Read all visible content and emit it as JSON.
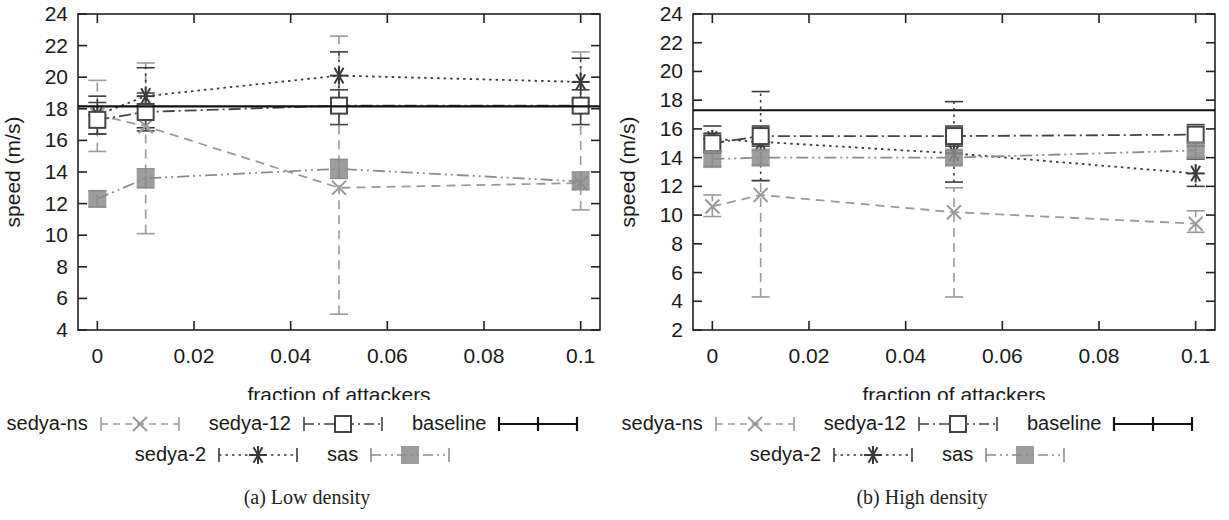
{
  "figure": {
    "panels": [
      {
        "id": "low-density",
        "caption": "(a) Low density",
        "chart_data": {
          "type": "line",
          "title": "",
          "subtitle": "",
          "xlabel": "fraction of attackers",
          "ylabel": "speed (m/s)",
          "x": [
            0,
            0.01,
            0.05,
            0.1
          ],
          "xticklabels": [
            "0",
            "0.02",
            "0.04",
            "0.06",
            "0.08",
            "0.1"
          ],
          "xticks": [
            0,
            0.02,
            0.04,
            0.06,
            0.08,
            0.1
          ],
          "xlim": [
            -0.004,
            0.104
          ],
          "yticklabels": [
            "4",
            "6",
            "8",
            "10",
            "12",
            "14",
            "16",
            "18",
            "20",
            "22",
            "24"
          ],
          "yticks": [
            4,
            6,
            8,
            10,
            12,
            14,
            16,
            18,
            20,
            22,
            24
          ],
          "ylim": [
            4,
            24
          ],
          "grid": false,
          "legend_position": "below",
          "series": [
            {
              "name": "sedya-ns",
              "marker": "x",
              "linestyle": "dashed",
              "color": "#9a9a9a",
              "values": [
                17.6,
                16.9,
                13.0,
                13.3
              ],
              "err_low": [
                15.3,
                10.1,
                5.0,
                11.6
              ],
              "err_high": [
                19.8,
                20.9,
                22.6,
                21.6
              ]
            },
            {
              "name": "sedya-2",
              "marker": "star",
              "linestyle": "dotted",
              "color": "#3a3a3a",
              "values": [
                17.6,
                18.8,
                20.1,
                19.7
              ],
              "err_low": [
                16.4,
                16.8,
                18.5,
                18.5
              ],
              "err_high": [
                18.8,
                20.6,
                21.6,
                21.2
              ]
            },
            {
              "name": "sedya-12",
              "marker": "open-square",
              "linestyle": "dashdot",
              "color": "#444444",
              "values": [
                17.3,
                17.8,
                18.2,
                18.2
              ],
              "err_low": [
                16.4,
                16.6,
                17.0,
                17.0
              ],
              "err_high": [
                18.4,
                19.0,
                19.2,
                19.2
              ]
            },
            {
              "name": "sas",
              "marker": "filled-square",
              "linestyle": "dashdotdot",
              "color": "#8c8c8c",
              "values": [
                12.3,
                13.6,
                14.2,
                13.4
              ],
              "err_low": [
                11.8,
                13.0,
                13.6,
                12.9
              ],
              "err_high": [
                12.8,
                14.2,
                14.8,
                14.0
              ]
            },
            {
              "name": "baseline",
              "marker": "none",
              "linestyle": "solid",
              "color": "#111111",
              "constant": 18.15,
              "values": [
                18.15,
                18.15,
                18.15,
                18.15
              ]
            }
          ]
        }
      },
      {
        "id": "high-density",
        "caption": "(b) High density",
        "chart_data": {
          "type": "line",
          "title": "",
          "subtitle": "",
          "xlabel": "fraction of attackers",
          "ylabel": "speed (m/s)",
          "x": [
            0,
            0.01,
            0.05,
            0.1
          ],
          "xticklabels": [
            "0",
            "0.02",
            "0.04",
            "0.06",
            "0.08",
            "0.1"
          ],
          "xticks": [
            0,
            0.02,
            0.04,
            0.06,
            0.08,
            0.1
          ],
          "xlim": [
            -0.004,
            0.104
          ],
          "yticklabels": [
            "2",
            "4",
            "6",
            "8",
            "10",
            "12",
            "14",
            "16",
            "18",
            "20",
            "22",
            "24"
          ],
          "yticks": [
            2,
            4,
            6,
            8,
            10,
            12,
            14,
            16,
            18,
            20,
            22,
            24
          ],
          "ylim": [
            2,
            24
          ],
          "grid": false,
          "legend_position": "below",
          "series": [
            {
              "name": "sedya-ns",
              "marker": "x",
              "linestyle": "dashed",
              "color": "#9a9a9a",
              "values": [
                10.6,
                11.4,
                10.2,
                9.4
              ],
              "err_low": [
                9.9,
                4.3,
                4.3,
                8.8
              ],
              "err_high": [
                11.4,
                12.4,
                11.9,
                10.3
              ]
            },
            {
              "name": "sedya-2",
              "marker": "star",
              "linestyle": "dotted",
              "color": "#3a3a3a",
              "values": [
                15.3,
                15.1,
                14.3,
                12.9
              ],
              "err_low": [
                14.4,
                12.4,
                12.3,
                12.0
              ],
              "err_high": [
                16.2,
                18.6,
                17.9,
                13.9
              ]
            },
            {
              "name": "sedya-12",
              "marker": "open-square",
              "linestyle": "dashdot",
              "color": "#444444",
              "values": [
                15.0,
                15.5,
                15.5,
                15.6
              ],
              "err_low": [
                14.3,
                14.8,
                14.8,
                14.8
              ],
              "err_high": [
                15.7,
                16.2,
                16.2,
                16.3
              ]
            },
            {
              "name": "sas",
              "marker": "filled-square",
              "linestyle": "dashdotdot",
              "color": "#8c8c8c",
              "values": [
                13.9,
                14.0,
                14.0,
                14.5
              ],
              "err_low": [
                13.4,
                13.5,
                13.5,
                14.0
              ],
              "err_high": [
                14.4,
                14.5,
                14.5,
                15.0
              ]
            },
            {
              "name": "baseline",
              "marker": "none",
              "linestyle": "solid",
              "color": "#111111",
              "constant": 17.3,
              "values": [
                17.3,
                17.3,
                17.3,
                17.3
              ]
            }
          ]
        }
      }
    ],
    "legend": {
      "rows": [
        [
          {
            "label": "sedya-ns",
            "key": "x"
          },
          {
            "label": "sedya-12",
            "key": "open-square"
          },
          {
            "label": "baseline",
            "key": "none"
          }
        ],
        [
          {
            "label": "sedya-2",
            "key": "star"
          },
          {
            "label": "sas",
            "key": "filled-square"
          }
        ]
      ]
    }
  }
}
